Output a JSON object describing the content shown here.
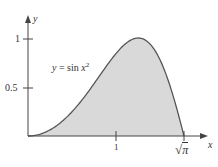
{
  "chart_data": {
    "type": "area",
    "title": "",
    "function_label": "y = sin x²",
    "function_label_parts": {
      "lhs": "y",
      "eq": " = sin ",
      "var": "x",
      "sup": "2"
    },
    "xlabel": "x",
    "ylabel": "y",
    "x_ticks": [
      {
        "value": 1,
        "label": "1"
      },
      {
        "value": 1.7725,
        "label": "√π"
      }
    ],
    "y_ticks": [
      {
        "value": 0.5,
        "label": "0.5"
      },
      {
        "value": 1,
        "label": "1"
      }
    ],
    "xlim": [
      0,
      1.95
    ],
    "ylim": [
      0,
      1.05
    ],
    "shaded_region": {
      "from": 0,
      "to": 1.7725,
      "description": "area under y = sin x² from 0 to √π"
    },
    "grid": false,
    "sample_points": [
      {
        "x": 0,
        "y": 0
      },
      {
        "x": 0.25,
        "y": 0.062
      },
      {
        "x": 0.5,
        "y": 0.247
      },
      {
        "x": 0.75,
        "y": 0.533
      },
      {
        "x": 1.0,
        "y": 0.841
      },
      {
        "x": 1.2533,
        "y": 1.0
      },
      {
        "x": 1.5,
        "y": 0.778
      },
      {
        "x": 1.7725,
        "y": 0
      }
    ],
    "colors": {
      "fill": "#d9d9d9",
      "curve": "#555555",
      "axis": "#444444"
    }
  },
  "labels": {
    "y_axis": "y",
    "x_axis": "x",
    "tick_1_y": "1",
    "tick_05_y": "0.5",
    "tick_1_x": "1",
    "tick_sqrtpi_sqrt": "√",
    "tick_sqrtpi_pi": "π",
    "func_lhs": "y",
    "func_mid": " = sin ",
    "func_var": "x",
    "func_sup": "2"
  }
}
